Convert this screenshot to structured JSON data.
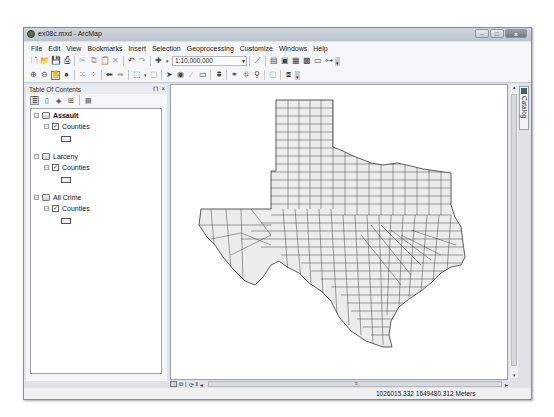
{
  "window": {
    "title": "ex08c.mxd - ArcMap",
    "controls": {
      "minimize": "–",
      "maximize": "□",
      "close": "x"
    }
  },
  "menubar": {
    "items": [
      "File",
      "Edit",
      "View",
      "Bookmarks",
      "Insert",
      "Selection",
      "Geoprocessing",
      "Customize",
      "Windows",
      "Help"
    ]
  },
  "standard_toolbar": {
    "icons": [
      "new-document",
      "open",
      "save",
      "print",
      "cut",
      "copy",
      "paste",
      "delete",
      "undo",
      "redo",
      "add-data"
    ],
    "scale_value": "1:10,000,000",
    "right_icons": [
      "editor",
      "table-of-contents",
      "catalog-window",
      "search-window",
      "arctoolbox",
      "python-window",
      "model-builder"
    ]
  },
  "tools_toolbar": {
    "icons": [
      "zoom-in",
      "zoom-out",
      "pan",
      "full-extent",
      "fixed-zoom-in",
      "fixed-zoom-out",
      "back-extent",
      "forward-extent",
      "select-features",
      "clear-selection",
      "select-elements",
      "identify",
      "hyperlink",
      "html-popup",
      "measure",
      "find",
      "find-route",
      "go-to-xy",
      "time-slider",
      "create-viewer-window"
    ]
  },
  "toc": {
    "title": "Table Of Contents",
    "pin": "⊓",
    "close": "×",
    "data_frames": [
      {
        "name": "Assault",
        "active": true,
        "layers": [
          {
            "name": "Counties",
            "checked": true
          }
        ]
      },
      {
        "name": "Larceny",
        "active": false,
        "layers": [
          {
            "name": "Counties",
            "checked": true
          }
        ]
      },
      {
        "name": "All Crime",
        "active": false,
        "layers": [
          {
            "name": "Counties",
            "checked": true
          }
        ]
      }
    ]
  },
  "map": {
    "content": "Texas counties",
    "fill_color": "#ececec",
    "stroke_color": "#333333"
  },
  "side_tabs": {
    "catalog": "Catalog"
  },
  "status": {
    "coordinates": "1026015.332  1649480.312 Meters"
  }
}
